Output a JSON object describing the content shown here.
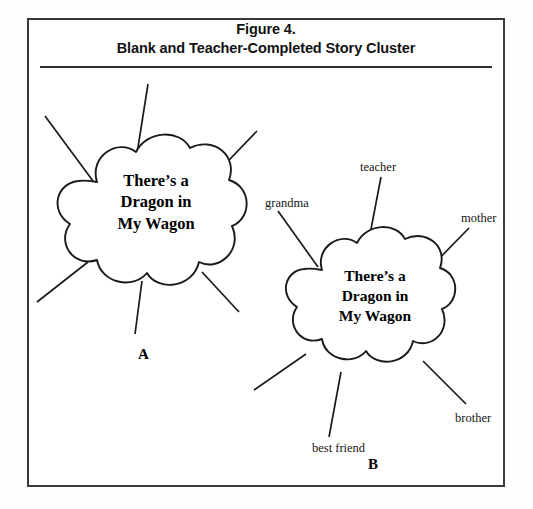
{
  "figure": {
    "title_line1": "Figure 4.",
    "title_line2": "Blank and Teacher-Completed Story Cluster",
    "border_color": "#3a3a3a",
    "rule_color": "#2e2e2e",
    "ink_color": "#000000",
    "background_color": "#ffffff"
  },
  "clusters": [
    {
      "id": "cloud-a",
      "panel_letter": "A",
      "center_text_line1": "There’s a",
      "center_text_line2": "Dragon in",
      "center_text_line3": "My Wagon",
      "branch_count": 6,
      "branch_labels": []
    },
    {
      "id": "cloud-b",
      "panel_letter": "B",
      "center_text_line1": "There’s a",
      "center_text_line2": "Dragon in",
      "center_text_line3": "My Wagon",
      "branch_count": 6,
      "branch_labels": [
        "teacher",
        "grandma",
        "mother",
        "brother",
        "best friend"
      ]
    }
  ],
  "labels": {
    "teacher": "teacher",
    "grandma": "grandma",
    "mother": "mother",
    "brother": "brother",
    "best_friend": "best friend"
  }
}
